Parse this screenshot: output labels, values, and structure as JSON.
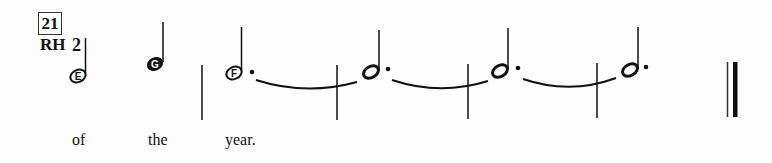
{
  "measure": {
    "number": "21",
    "hand": "RH",
    "finger": "2"
  },
  "notes": [
    {
      "letter": "E",
      "type": "half",
      "dotted": false,
      "x": 78,
      "y": 76,
      "stem_top": 38
    },
    {
      "letter": "G",
      "type": "quarter",
      "dotted": false,
      "x": 155,
      "y": 64,
      "stem_top": 22
    },
    {
      "letter": "F",
      "type": "dotted-half",
      "dotted": true,
      "x": 234,
      "y": 73,
      "stem_top": 27,
      "tied": true
    },
    {
      "letter": "",
      "type": "dotted-half",
      "dotted": true,
      "x": 372,
      "y": 72,
      "stem_top": 30,
      "tied": true
    },
    {
      "letter": "",
      "type": "dotted-half",
      "dotted": true,
      "x": 500,
      "y": 71,
      "stem_top": 28,
      "tied": true
    },
    {
      "letter": "",
      "type": "dotted-half",
      "dotted": true,
      "x": 630,
      "y": 70,
      "stem_top": 27,
      "tied": false
    }
  ],
  "barlines": [
    202,
    337,
    468,
    597
  ],
  "final_barline": {
    "thin_x": 727,
    "thick_x": 735
  },
  "lyrics": [
    {
      "text": "of",
      "x": 72
    },
    {
      "text": "the",
      "x": 148
    },
    {
      "text": "year.",
      "x": 225
    }
  ]
}
